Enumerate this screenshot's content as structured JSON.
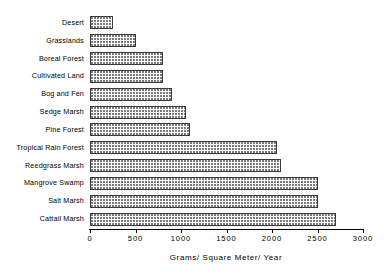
{
  "chart_data": {
    "type": "bar",
    "orientation": "horizontal",
    "title": "",
    "xlabel": "Grams/ Square Meter/ Year",
    "ylabel": "",
    "xlim": [
      0,
      3000
    ],
    "xticks": [
      0,
      500,
      1000,
      1500,
      2000,
      2500,
      3000
    ],
    "xtick_labels": [
      "0",
      "500",
      "1000",
      "1500",
      "2000",
      "2500",
      "3000"
    ],
    "grid": false,
    "legend": false,
    "categories": [
      "Desert",
      "Grasslands",
      "Boreal  Forest",
      "Cultivated  Land",
      "Bog and Fen",
      "Sedge Marsh",
      "Pine  Forest",
      "Tropical  Rain  Forest",
      "Reedgrass Marsh",
      "Mangrove Swamp",
      "Salt  Marsh",
      "Cattail  Marsh"
    ],
    "values": [
      250,
      500,
      800,
      800,
      900,
      1050,
      1100,
      2050,
      2100,
      2500,
      2500,
      2700
    ],
    "bar_style": {
      "fill": "#ffffff",
      "pattern": "dotted",
      "pattern_color": "#7a7a7a",
      "edge_color": "#3a3a3a"
    }
  }
}
